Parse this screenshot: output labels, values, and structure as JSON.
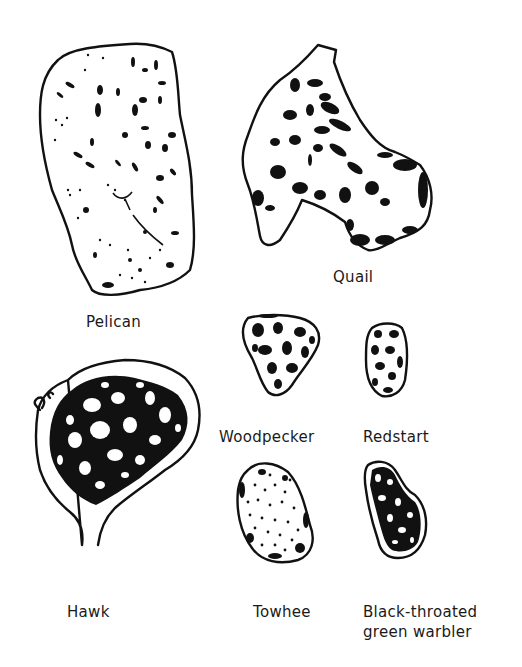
{
  "figure": {
    "colors": {
      "ink": "#111111",
      "background": "#ffffff",
      "label": "#1a1a1a"
    },
    "specimens": [
      {
        "id": "pelican",
        "label": "Pelican",
        "pattern": "sparse-specks"
      },
      {
        "id": "quail",
        "label": "Quail",
        "pattern": "large-blotches"
      },
      {
        "id": "woodpecker",
        "label": "Woodpecker",
        "pattern": "reticulate"
      },
      {
        "id": "redstart",
        "label": "Redstart",
        "pattern": "reticulate-fine"
      },
      {
        "id": "hawk",
        "label": "Hawk",
        "pattern": "dense-reticulate"
      },
      {
        "id": "towhee",
        "label": "Towhee",
        "pattern": "fine-speckle"
      },
      {
        "id": "warbler",
        "label": "Black-throated green warbler",
        "label_lines": [
          "Black-throated",
          "green warbler"
        ],
        "pattern": "dense-blotches"
      }
    ]
  }
}
